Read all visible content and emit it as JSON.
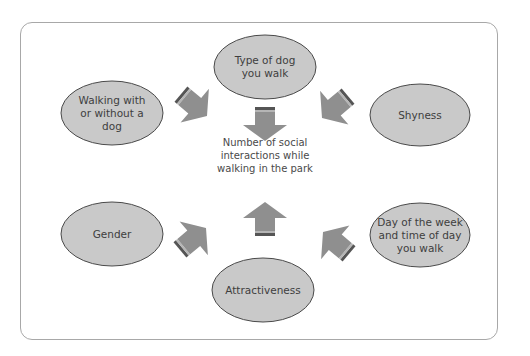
{
  "diagram": {
    "type": "factor-influence diagram",
    "center": {
      "label": "Number of social\ninteractions while\nwalking in the park"
    },
    "factors": [
      {
        "id": "type-of-dog",
        "label": "Type of dog\nyou walk",
        "position": "top"
      },
      {
        "id": "shyness",
        "label": "Shyness",
        "position": "upper-right"
      },
      {
        "id": "day-time",
        "label": "Day of the week\nand time of day\nyou walk",
        "position": "lower-right"
      },
      {
        "id": "attractiveness",
        "label": "Attractiveness",
        "position": "bottom"
      },
      {
        "id": "gender",
        "label": "Gender",
        "position": "lower-left"
      },
      {
        "id": "walking-dog",
        "label": "Walking with\nor without a\ndog",
        "position": "upper-left"
      }
    ],
    "colors": {
      "ellipse_fill": "#c9c9c9",
      "ellipse_stroke": "#4a4a4a",
      "arrow_fill": "#8f8f8f",
      "arrow_band_dark": "#555555",
      "arrow_band_light": "#b5b5b5",
      "frame_stroke": "#a8a8a8"
    }
  }
}
